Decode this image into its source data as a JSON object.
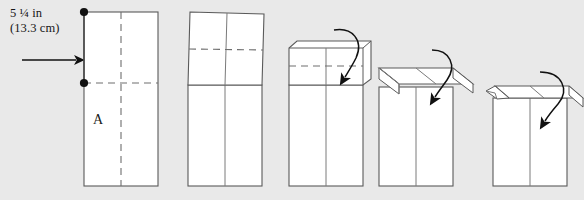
{
  "diagram": {
    "background_color": "#e9e9e9",
    "line_color": "#5a5a5a",
    "dashed_color": "#6e6e6e",
    "arrow_color": "#111111",
    "dot_color": "#111111",
    "annotations": {
      "measurement_line1": "5 ¼ in",
      "measurement_line2": "(13.3 cm)",
      "panel_letter": "A"
    },
    "steps": [
      {
        "index": 1,
        "name": "flat-sheet",
        "description": "Flat tall rectangle with vertical center crease and horizontal fold line, panel A marked, two endpoint dots on left edge marking the 5 1/4 in span"
      },
      {
        "index": 2,
        "name": "flap-tilted",
        "description": "Top section tilted up and skewed, dashed horizontal crease across the tilted flap"
      },
      {
        "index": 3,
        "name": "flap-upright-arrow",
        "description": "Top flap standing upright with dashed crease and a curved arrow sweeping down into it"
      },
      {
        "index": 4,
        "name": "flap-folding-down",
        "description": "Flap folded down to a flat parallelogram lid with a diagonal crease at left and a curved arrow pointing down"
      },
      {
        "index": 5,
        "name": "flap-closed",
        "description": "Lid closed with a small curled corner tab at the left and a curved arrow pointing down"
      }
    ]
  }
}
